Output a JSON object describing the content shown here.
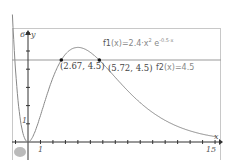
{
  "chart_data": {
    "type": "line",
    "title": "",
    "xlabel": "x",
    "ylabel": "y",
    "xlim": [
      -1.3,
      15.2
    ],
    "ylim": [
      -1,
      6.3
    ],
    "x_tick_labels": [
      "1",
      "15"
    ],
    "y_tick_labels": [
      "1",
      "6"
    ],
    "series": [
      {
        "name": "f1(x)=2.4·x²·e^(-0.5x)",
        "label": "f1(x)=2.4·x",
        "exp_base": "2",
        "e_part": "e",
        "exponent": "-0.5·x",
        "type": "function",
        "color": "#888888"
      },
      {
        "name": "f2(x)=4.5",
        "label": "f2(x)=4.5",
        "type": "function",
        "color": "#888888"
      }
    ],
    "points": [
      {
        "x": 2.67,
        "y": 4.5,
        "label": "(2.67, 4.5)"
      },
      {
        "x": 5.72,
        "y": 4.5,
        "label": "(5.72, 4.5)"
      }
    ],
    "grid": false
  },
  "labels": {
    "f1_prefix": "f1",
    "f1_body": "(x)=2.4·x",
    "f1_sq": "2",
    "f1_e": " e",
    "f1_exp": "-0.5·x",
    "f2_prefix": "f2",
    "f2_body": "(x)=4.5",
    "pt1": "(2.67, 4.5)",
    "pt2": "(5.72, 4.5)",
    "x_axis": "x",
    "y_axis": "y",
    "x_tick_1": "1",
    "x_tick_15": "15",
    "y_tick_1": "1",
    "y_tick_6": "6"
  }
}
